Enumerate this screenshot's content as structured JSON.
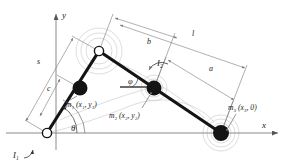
{
  "figure": {
    "type": "mechanism-kinematic-diagram",
    "background": "#ffffff",
    "ink_color": "#1a1a1a",
    "dimension_color": "#7a7a7a",
    "ghost_color": "#c9c9c9"
  },
  "axes": {
    "x_label": "x",
    "y_label": "y",
    "origin_label": ""
  },
  "joints": [
    {
      "name": "ground-pivot",
      "style": "open",
      "x": 47,
      "y": 133
    },
    {
      "name": "crank-tip-pivot",
      "style": "open",
      "x": 99,
      "y": 51
    }
  ],
  "masses": [
    {
      "id": "m1",
      "label": "m₁ (x₁, y₁)",
      "style": "filled",
      "x": 80,
      "y": 88,
      "label_x": 73,
      "label_y": 103
    },
    {
      "id": "m2",
      "label": "m₂ (x₂, y₂)",
      "style": "filled",
      "x": 154,
      "y": 88,
      "label_x": 116,
      "label_y": 118
    },
    {
      "id": "m3",
      "label": "m₃ (x₃, 0)",
      "style": "filled",
      "x": 221,
      "y": 133,
      "label_x": 228,
      "label_y": 110
    }
  ],
  "links": [
    {
      "name": "crank",
      "from": "ground-pivot",
      "to": "crank-tip-pivot"
    },
    {
      "name": "connecting-rod",
      "from": "crank-tip-pivot",
      "to": "slider"
    }
  ],
  "angles": [
    {
      "id": "theta",
      "label": "θ",
      "at": "ground-pivot",
      "label_x": 71,
      "label_y": 131
    },
    {
      "id": "phi",
      "label": "φ",
      "at": "connecting-rod",
      "label_x": 128,
      "label_y": 84
    }
  ],
  "inertias": [
    {
      "id": "I1",
      "label": "I₁",
      "label_x": 17,
      "label_y": 155
    },
    {
      "id": "I2",
      "label": "I₂",
      "label_x": 157,
      "label_y": 66
    }
  ],
  "dimensions": [
    {
      "id": "b",
      "label": "b",
      "label_x": 147,
      "label_y": 44,
      "note": "pivot to m2 along rod"
    },
    {
      "id": "l",
      "label": "l",
      "label_x": 192,
      "label_y": 36,
      "note": "full connecting rod length"
    },
    {
      "id": "a",
      "label": "a",
      "label_x": 209,
      "label_y": 71,
      "note": "m2 to slider along rod"
    },
    {
      "id": "s",
      "label": "s",
      "label_x": 37,
      "label_y": 64,
      "note": "full crank length"
    },
    {
      "id": "c",
      "label": "c",
      "label_x": 47,
      "label_y": 91,
      "note": "pivot to m1 along crank"
    }
  ]
}
